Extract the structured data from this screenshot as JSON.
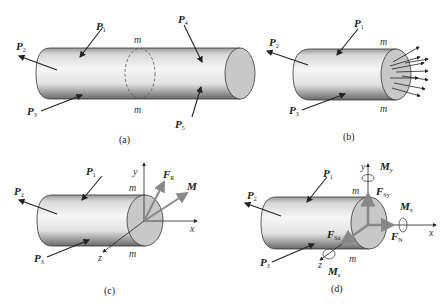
{
  "figure": {
    "panels": [
      {
        "id": "a",
        "caption": "(a)",
        "loads": [
          {
            "name": "P",
            "sub": "1"
          },
          {
            "name": "P",
            "sub": "2"
          },
          {
            "name": "P",
            "sub": "3"
          },
          {
            "name": "P",
            "sub": "4"
          },
          {
            "name": "P",
            "sub": "5"
          }
        ],
        "section_labels": [
          "m",
          "m"
        ]
      },
      {
        "id": "b",
        "caption": "(b)",
        "loads": [
          {
            "name": "P",
            "sub": "1"
          },
          {
            "name": "P",
            "sub": "2"
          },
          {
            "name": "P",
            "sub": "3"
          }
        ],
        "section_labels": [
          "m",
          "m"
        ]
      },
      {
        "id": "c",
        "caption": "(c)",
        "loads": [
          {
            "name": "P",
            "sub": "1"
          },
          {
            "name": "P",
            "sub": "2"
          },
          {
            "name": "P",
            "sub": "3"
          }
        ],
        "section_labels": [
          "m",
          "m"
        ],
        "axes": [
          "x",
          "y",
          "z"
        ],
        "resultants": [
          {
            "name": "F",
            "sub": "R"
          },
          {
            "name": "M",
            "sub": ""
          }
        ]
      },
      {
        "id": "d",
        "caption": "(d)",
        "loads": [
          {
            "name": "P",
            "sub": "1"
          },
          {
            "name": "P",
            "sub": "2"
          },
          {
            "name": "P",
            "sub": "3"
          }
        ],
        "section_labels": [
          "m",
          "m"
        ],
        "axes": [
          "x",
          "y",
          "z"
        ],
        "components": [
          {
            "name": "F",
            "sub": "Sy"
          },
          {
            "name": "F",
            "sub": "Sz"
          },
          {
            "name": "F",
            "sub": "N"
          },
          {
            "name": "M",
            "sub": "x"
          },
          {
            "name": "M",
            "sub": "y"
          },
          {
            "name": "M",
            "sub": "z"
          }
        ]
      }
    ]
  }
}
